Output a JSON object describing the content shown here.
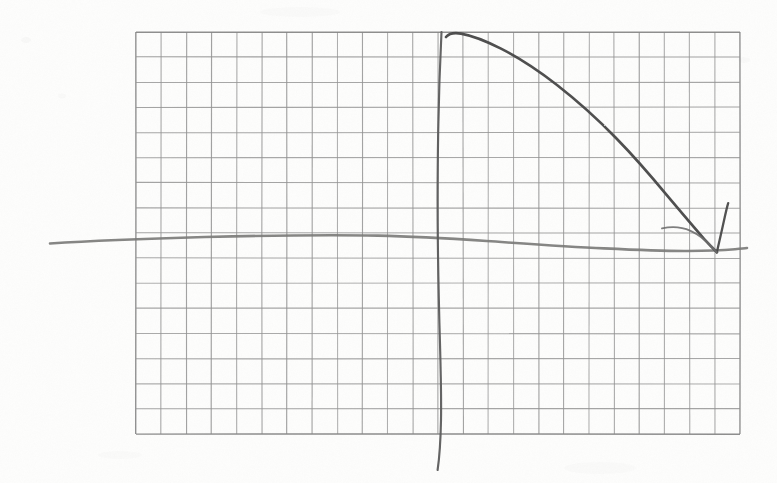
{
  "scene": {
    "title": "Hand-drawn decaying curve on graph paper",
    "width": 777,
    "height": 483,
    "paper_color": "#fdfdfc",
    "ink_color": "#4a4a4a",
    "grid_color": "#8a8a8a",
    "axis_color": "#6e6e6e"
  },
  "grid": {
    "name": "graph-paper-grid",
    "left": 136,
    "top": 32,
    "right": 740,
    "bottom": 434,
    "columns": 24,
    "rows": 16,
    "cell_width": 25.17,
    "cell_height": 25.13,
    "line_color": "#8a8a8a",
    "line_width": 1.1,
    "border_color": "#7d7d7d",
    "border_width": 1.4
  },
  "chart_data": {
    "type": "line",
    "subtitle": "",
    "xlabel": "",
    "ylabel": "",
    "grid": true,
    "legend_position": "none",
    "axes": {
      "vertical_axis": {
        "name": "y-axis",
        "hand_drawn": true,
        "x_pixel": 441,
        "top_pixel": 32,
        "bottom_pixel": 470,
        "extends_below_grid": true,
        "grid_column_index": 12,
        "color": "#5c5c5c",
        "stroke_width": 2.1
      },
      "horizontal_axis": {
        "name": "x-axis",
        "hand_drawn": true,
        "y_pixel": 243,
        "left_pixel": 50,
        "right_pixel": 747,
        "extends_outside_grid": true,
        "grid_row_index": 8,
        "color": "#7a7a78",
        "stroke_width": 2.6
      }
    },
    "origin_pixel": [
      441,
      245
    ],
    "series": [
      {
        "name": "decay-curve",
        "description": "convex decreasing curve from peak near the y-axis down to the x-axis, terminating in an arrowhead",
        "color": "#4a4a4a",
        "stroke_width": 2.6,
        "points_pixel": [
          [
            447,
            36
          ],
          [
            455,
            33
          ],
          [
            470,
            35
          ],
          [
            495,
            45
          ],
          [
            525,
            62
          ],
          [
            560,
            88
          ],
          [
            596,
            120
          ],
          [
            630,
            157
          ],
          [
            660,
            193
          ],
          [
            686,
            221
          ],
          [
            703,
            238
          ],
          [
            714,
            248
          ],
          [
            717,
            252
          ]
        ],
        "normalized_points": [
          [
            0.0,
            1.0
          ],
          [
            0.03,
            1.0
          ],
          [
            0.09,
            0.99
          ],
          [
            0.18,
            0.95
          ],
          [
            0.29,
            0.87
          ],
          [
            0.42,
            0.75
          ],
          [
            0.55,
            0.6
          ],
          [
            0.68,
            0.43
          ],
          [
            0.79,
            0.26
          ],
          [
            0.89,
            0.13
          ],
          [
            0.95,
            0.05
          ],
          [
            0.99,
            0.01
          ],
          [
            1.0,
            0.0
          ]
        ]
      }
    ],
    "annotations": [
      {
        "name": "arrowhead",
        "type": "arrow",
        "description": "V-shaped arrow barb at the curve terminus pointing down-left toward the x-axis",
        "tip_pixel": [
          717,
          252
        ],
        "barb_pixel": [
          728,
          203
        ],
        "color": "#4a4a4a",
        "stroke_width": 2.4
      },
      {
        "name": "approach-arc",
        "type": "arc",
        "description": "small light arc sweeping from the left into the arrow tip",
        "start_pixel": [
          662,
          228
        ],
        "end_pixel": [
          716,
          251
        ],
        "color": "#6d6d6d",
        "stroke_width": 1.9
      }
    ],
    "xlim": [
      0,
      24
    ],
    "ylim": [
      0,
      16
    ]
  }
}
